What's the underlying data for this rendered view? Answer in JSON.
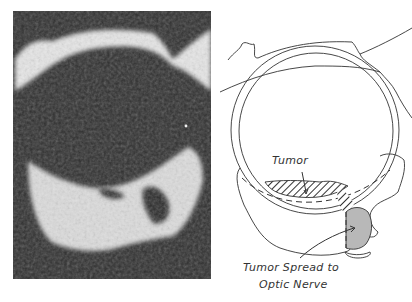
{
  "figure": {
    "left_panel": {
      "type": "ultrasound-scan",
      "description": "B-scan ultrasound image of eye with posterior tumor"
    },
    "right_panel": {
      "type": "schematic-drawing",
      "labels": {
        "tumor": "Tumor",
        "spread_line1": "Tumor Spread to",
        "spread_line2": "Optic Nerve"
      }
    },
    "colors": {
      "photo_background": "#2c2c2c",
      "echo_white": "#e8e8e8",
      "line": "#333333",
      "optic_shade": "#b8b8b8"
    }
  }
}
